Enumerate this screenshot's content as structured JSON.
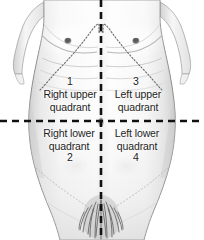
{
  "figure": {
    "alt": "Anterior view of human torso divided into four abdominal quadrants by two dashed lines",
    "background_color": "#ffffff",
    "text_color": "#1d1d1d",
    "dash_color": "#111111",
    "outline_color": "#8e8e8e",
    "costal_margin_color": "#6b6b6b",
    "skin_shade_light": "#fbfbfb",
    "skin_shade_mid": "#e6e6e6",
    "skin_shade_dark": "#c9c9c9"
  },
  "divider_lines": {
    "vertical": {
      "name": "median-vertical-dashed-line",
      "x": 101,
      "y_start": 0,
      "y_end": 240,
      "dash": "7 5",
      "width": 2.6
    },
    "horizontal": {
      "name": "transumbilical-horizontal-dashed-line",
      "y": 121,
      "x_start": 0,
      "x_end": 204,
      "dash": "7 5",
      "width": 2.6
    }
  },
  "quadrants": [
    {
      "id": "right-upper-quadrant",
      "number": "1",
      "line1": "Right upper",
      "line2": "quadrant",
      "number_position": "above"
    },
    {
      "id": "left-upper-quadrant",
      "number": "3",
      "line1": "Left upper",
      "line2": "quadrant",
      "number_position": "above"
    },
    {
      "id": "right-lower-quadrant",
      "number": "2",
      "line1": "Right lower",
      "line2": "quadrant",
      "number_position": "below"
    },
    {
      "id": "left-lower-quadrant",
      "number": "4",
      "line1": "Left lower",
      "line2": "quadrant",
      "number_position": "below"
    }
  ]
}
